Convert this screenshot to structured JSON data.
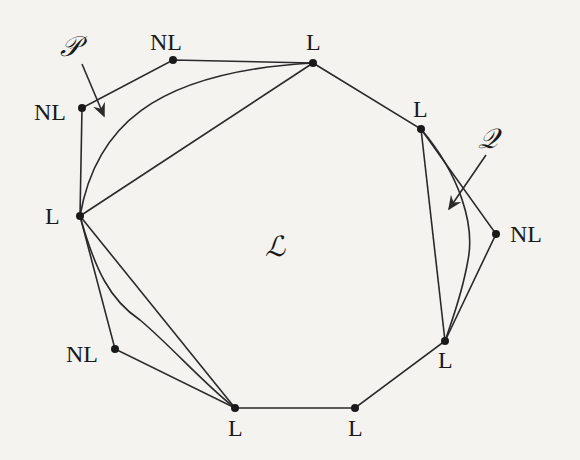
{
  "diagram": {
    "region_label": "ℒ",
    "curve_labels": [
      {
        "name": "P",
        "text": "𝒫"
      },
      {
        "name": "Q",
        "text": "𝒬"
      }
    ],
    "vertices": [
      {
        "id": "v1",
        "label": "NL",
        "x": 173,
        "y": 60
      },
      {
        "id": "v2",
        "label": "L",
        "x": 313,
        "y": 63
      },
      {
        "id": "v3",
        "label": "L",
        "x": 421,
        "y": 129
      },
      {
        "id": "v4",
        "label": "NL",
        "x": 496,
        "y": 234
      },
      {
        "id": "v5",
        "label": "L",
        "x": 445,
        "y": 341
      },
      {
        "id": "v6",
        "label": "L",
        "x": 355,
        "y": 408
      },
      {
        "id": "v7",
        "label": "L",
        "x": 235,
        "y": 408
      },
      {
        "id": "v8",
        "label": "NL",
        "x": 115,
        "y": 349
      },
      {
        "id": "v9",
        "label": "L",
        "x": 80,
        "y": 216
      },
      {
        "id": "v10",
        "label": "NL",
        "x": 82,
        "y": 108
      }
    ],
    "colors": {
      "stroke": "#2a2a2a",
      "text": "#1a1a1a",
      "background": "#f4f3f0"
    }
  }
}
